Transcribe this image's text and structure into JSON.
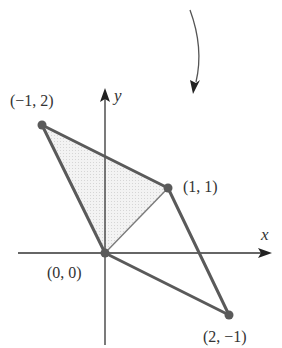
{
  "figure": {
    "type": "linear-transformation-diagram"
  },
  "axes": {
    "x_label": "x",
    "y_label": "y"
  },
  "points": [
    {
      "id": "p_origin",
      "label": "(0, 0)",
      "x": 0,
      "y": 0
    },
    {
      "id": "p_a",
      "label": "(−1, 2)",
      "x": -1,
      "y": 2
    },
    {
      "id": "p_b",
      "label": "(1, 1)",
      "x": 1,
      "y": 1
    },
    {
      "id": "p_c",
      "label": "(2, −1)",
      "x": 2,
      "y": -1
    }
  ],
  "labels": {
    "origin": "(0, 0)",
    "a": "(−1, 2)",
    "b": "(1, 1)",
    "c": "(2, −1)"
  },
  "shaded_region": {
    "vertices": [
      "(0, 0)",
      "(−1, 2)",
      "(1, 1)"
    ]
  },
  "colors": {
    "edge": "#5a5a5a",
    "inner_edge": "#7a7a7a",
    "axis": "#333333",
    "shade": "#ececec",
    "point": "#5a5a5a"
  },
  "icons": {
    "curved_arrow": "curved-arrow-icon"
  }
}
